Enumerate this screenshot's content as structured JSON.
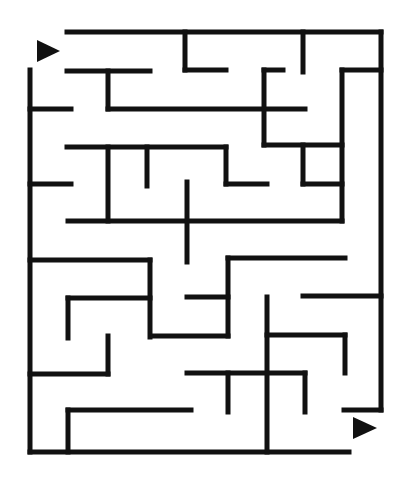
{
  "maze": {
    "width": 412,
    "height": 480,
    "background": "#ffffff",
    "wall_color": "#111111",
    "wall_thickness": 5,
    "start_marker": {
      "direction": "right",
      "points": "37,40 60,51 37,62"
    },
    "end_marker": {
      "direction": "right",
      "points": "353,417 377,428 353,439"
    },
    "walls": [
      [
        67,
        32,
        381,
        32
      ],
      [
        381,
        32,
        381,
        410
      ],
      [
        344,
        410,
        381,
        410
      ],
      [
        30,
        70,
        30,
        452
      ],
      [
        30,
        452,
        349,
        452
      ],
      [
        185,
        32,
        185,
        70
      ],
      [
        185,
        70,
        226,
        70
      ],
      [
        303,
        32,
        303,
        72
      ],
      [
        67,
        71,
        150,
        71
      ],
      [
        108,
        71,
        108,
        109
      ],
      [
        108,
        109,
        305,
        109
      ],
      [
        30,
        109,
        71,
        109
      ],
      [
        264,
        70,
        264,
        145
      ],
      [
        264,
        70,
        283,
        70
      ],
      [
        264,
        145,
        342,
        145
      ],
      [
        342,
        70,
        381,
        70
      ],
      [
        342,
        70,
        342,
        221
      ],
      [
        67,
        147,
        226,
        147
      ],
      [
        108,
        147,
        108,
        221
      ],
      [
        147,
        147,
        147,
        186
      ],
      [
        226,
        147,
        226,
        184
      ],
      [
        226,
        184,
        267,
        184
      ],
      [
        30,
        184,
        71,
        184
      ],
      [
        303,
        145,
        303,
        184
      ],
      [
        303,
        184,
        342,
        184
      ],
      [
        68,
        221,
        342,
        221
      ],
      [
        187,
        182,
        187,
        262
      ],
      [
        30,
        260,
        150,
        260
      ],
      [
        150,
        260,
        150,
        337
      ],
      [
        68,
        298,
        150,
        298
      ],
      [
        68,
        298,
        68,
        338
      ],
      [
        228,
        258,
        345,
        258
      ],
      [
        228,
        258,
        228,
        336
      ],
      [
        187,
        297,
        228,
        297
      ],
      [
        153,
        336,
        228,
        336
      ],
      [
        267,
        297,
        267,
        452
      ],
      [
        303,
        296,
        381,
        296
      ],
      [
        267,
        335,
        345,
        335
      ],
      [
        345,
        335,
        345,
        373
      ],
      [
        108,
        336,
        108,
        374
      ],
      [
        30,
        374,
        108,
        374
      ],
      [
        187,
        373,
        305,
        373
      ],
      [
        228,
        373,
        228,
        412
      ],
      [
        305,
        373,
        305,
        412
      ],
      [
        68,
        410,
        191,
        410
      ],
      [
        68,
        410,
        68,
        452
      ]
    ]
  }
}
